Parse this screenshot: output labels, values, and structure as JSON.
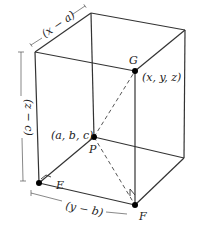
{
  "diagram": {
    "type": "rectangular-box-3d",
    "points": {
      "G": {
        "label": "G",
        "coords": "(x, y, z)"
      },
      "P": {
        "label": "P",
        "coords": "(a, b, c)"
      },
      "E": {
        "label": "E"
      },
      "F": {
        "label": "F"
      }
    },
    "dimensions": {
      "depth": "(x − a)",
      "height": "(z − c)",
      "width": "(y − b)"
    },
    "colors": {
      "line": "#333333",
      "point": "#000000",
      "background": "#ffffff"
    }
  }
}
